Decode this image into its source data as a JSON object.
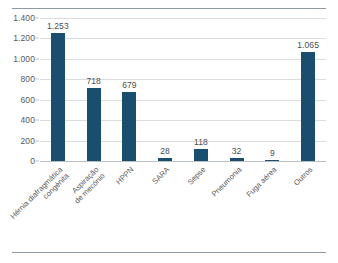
{
  "chart_data": {
    "type": "bar",
    "title": "",
    "subtitle": "",
    "xlabel": "",
    "ylabel": "",
    "categories": [
      "Hérnia diafragmática congénita",
      "Aspiração de mecónio",
      "HPPN",
      "SARA",
      "Sepse",
      "Pneumonia",
      "Fuga aérea",
      "Outros"
    ],
    "category_lines": [
      [
        "Hérnia diafragmática",
        "congénita"
      ],
      [
        "Aspiração",
        "de mecónio"
      ],
      [
        "HPPN",
        ""
      ],
      [
        "SARA",
        ""
      ],
      [
        "Sepse",
        ""
      ],
      [
        "Pneumonia",
        ""
      ],
      [
        "Fuga aérea",
        ""
      ],
      [
        "Outros",
        ""
      ]
    ],
    "values": [
      1253,
      718,
      679,
      28,
      118,
      32,
      9,
      1065
    ],
    "value_labels": [
      "1.253",
      "718",
      "679",
      "28",
      "118",
      "32",
      "9",
      "1.065"
    ],
    "ylim": [
      0,
      1400
    ],
    "yticks": [
      0,
      200,
      400,
      600,
      800,
      1000,
      1200,
      1400
    ],
    "ytick_labels": [
      "0",
      "200",
      "400",
      "600",
      "800",
      "1.000",
      "1.200",
      "1.400"
    ],
    "grid": true,
    "grid_axis": "y",
    "legend": false,
    "legend_position": "none",
    "series": [
      {
        "name": "",
        "color": "#194e6e",
        "values": [
          1253,
          718,
          679,
          28,
          118,
          32,
          9,
          1065
        ]
      }
    ]
  },
  "style": {
    "bar_color": "#194e6e",
    "grid_color": "#d9dde0",
    "axis_color": "#b9c0c5",
    "rule_color": "#8b9aa3",
    "text_color": "#58595b",
    "background": "#ffffff"
  }
}
